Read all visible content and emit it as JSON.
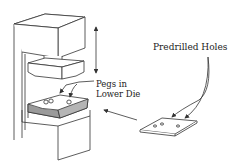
{
  "diagram": {
    "labels": {
      "predrilled_holes": "Predrilled Holes",
      "pegs_line1": "Pegs in",
      "pegs_line2": "Lower Die"
    },
    "components": [
      "press-frame",
      "upper-ram",
      "upper-die",
      "lower-die",
      "pegs",
      "workpiece-sheet",
      "feed-arrow",
      "stroke-arrow"
    ],
    "colors": {
      "line": "#333333",
      "die_fill": "#9a9a9a",
      "background": "#ffffff"
    }
  }
}
